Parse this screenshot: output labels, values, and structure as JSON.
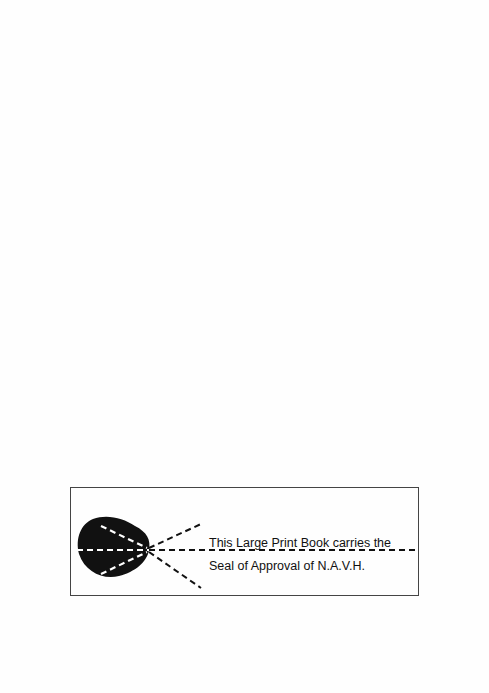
{
  "seal_notice": {
    "line1": "This Large Print Book carries the",
    "line2": "Seal of  Approval of N.A.V.H.",
    "icon": "eye-seal-icon"
  }
}
